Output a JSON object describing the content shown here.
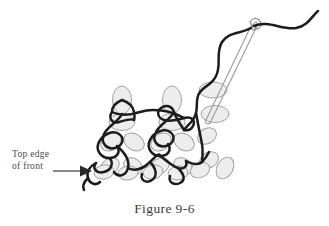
{
  "figure": {
    "caption": "Figure 9-6",
    "background_color": "#ffffff"
  },
  "annotation": {
    "label_line1": "Top edge",
    "label_line2": "of front",
    "text_color": "#4a4a4a",
    "arrow_name": "arrow-pointing-right"
  },
  "illustration": {
    "subject": "knitting-graft-stitch-diagram",
    "fabric_loop_fill": "#ededed",
    "fabric_loop_stroke": "#9a9a9a",
    "working_yarn_color": "#1c1c1c",
    "needle_color": "#8a8a8a",
    "needle_name": "tapestry-needle",
    "yarn_name": "working-yarn",
    "fabric_name": "knit-stitch-fabric"
  }
}
